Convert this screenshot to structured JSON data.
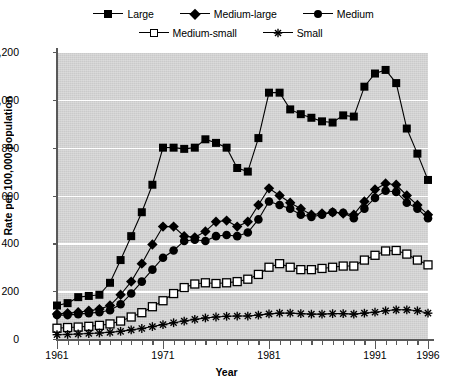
{
  "chart_data": {
    "type": "line",
    "title": "",
    "xlabel": "Year",
    "ylabel": "Rate per 100,000 population",
    "xlim": [
      1961,
      1996
    ],
    "ylim": [
      0,
      1200
    ],
    "ytick_values": [
      0,
      200,
      400,
      600,
      800,
      1000,
      1200
    ],
    "ytick_labels": [
      "0",
      "200",
      "400",
      "600",
      "800",
      "1,000",
      "1,200"
    ],
    "xtick_values": [
      1961,
      1971,
      1981,
      1991,
      1996
    ],
    "xtick_labels": [
      "1961",
      "1971",
      "1981",
      "1991",
      "1996"
    ],
    "xtick_minor_step": 1,
    "grid": "horizontal-white",
    "legend_position": "top",
    "x": [
      1961,
      1962,
      1963,
      1964,
      1965,
      1966,
      1967,
      1968,
      1969,
      1970,
      1971,
      1972,
      1973,
      1974,
      1975,
      1976,
      1977,
      1978,
      1979,
      1980,
      1981,
      1982,
      1983,
      1984,
      1985,
      1986,
      1987,
      1988,
      1989,
      1990,
      1991,
      1992,
      1993,
      1994,
      1995,
      1996
    ],
    "series": [
      {
        "name": "Large",
        "marker": "filled-square",
        "color": "#000000",
        "values": [
          140,
          150,
          175,
          180,
          185,
          235,
          330,
          430,
          530,
          645,
          800,
          800,
          795,
          800,
          835,
          820,
          800,
          715,
          700,
          840,
          1030,
          1030,
          960,
          940,
          925,
          910,
          905,
          935,
          930,
          1055,
          1110,
          1125,
          1070,
          880,
          775,
          665
        ]
      },
      {
        "name": "Medium-large",
        "marker": "filled-diamond",
        "color": "#000000",
        "values": [
          105,
          108,
          112,
          118,
          125,
          140,
          185,
          240,
          315,
          395,
          470,
          470,
          430,
          425,
          450,
          490,
          495,
          470,
          490,
          560,
          630,
          600,
          570,
          545,
          520,
          525,
          530,
          525,
          520,
          575,
          625,
          650,
          645,
          600,
          560,
          520
        ]
      },
      {
        "name": "Medium",
        "marker": "filled-circle",
        "color": "#000000",
        "values": [
          100,
          100,
          104,
          108,
          112,
          120,
          145,
          190,
          240,
          290,
          340,
          370,
          410,
          415,
          410,
          430,
          435,
          430,
          445,
          500,
          575,
          560,
          545,
          520,
          510,
          520,
          530,
          528,
          505,
          545,
          590,
          620,
          615,
          570,
          545,
          505
        ]
      },
      {
        "name": "Medium-small",
        "marker": "open-square",
        "color": "#000000",
        "values": [
          45,
          48,
          50,
          53,
          57,
          63,
          75,
          92,
          110,
          135,
          160,
          190,
          215,
          230,
          235,
          232,
          235,
          240,
          250,
          270,
          300,
          315,
          300,
          290,
          290,
          295,
          300,
          305,
          305,
          330,
          350,
          368,
          370,
          355,
          330,
          310
        ]
      },
      {
        "name": "Small",
        "marker": "asterisk",
        "color": "#000000",
        "values": [
          18,
          19,
          21,
          23,
          25,
          28,
          32,
          38,
          44,
          52,
          60,
          68,
          75,
          82,
          88,
          92,
          95,
          96,
          96,
          100,
          105,
          108,
          108,
          106,
          104,
          104,
          106,
          106,
          104,
          108,
          112,
          118,
          122,
          122,
          118,
          108
        ]
      }
    ]
  },
  "legend": {
    "rows": [
      [
        {
          "label": "Large",
          "marker": "filled-square"
        },
        {
          "label": "Medium-large",
          "marker": "filled-diamond"
        },
        {
          "label": "Medium",
          "marker": "filled-circle"
        }
      ],
      [
        {
          "label": "Medium-small",
          "marker": "open-square"
        },
        {
          "label": "Small",
          "marker": "asterisk"
        }
      ]
    ]
  },
  "colors": {
    "plot_background": "#d4d4d4",
    "gridline": "#ffffff",
    "axis": "#595959",
    "ink": "#000000"
  }
}
